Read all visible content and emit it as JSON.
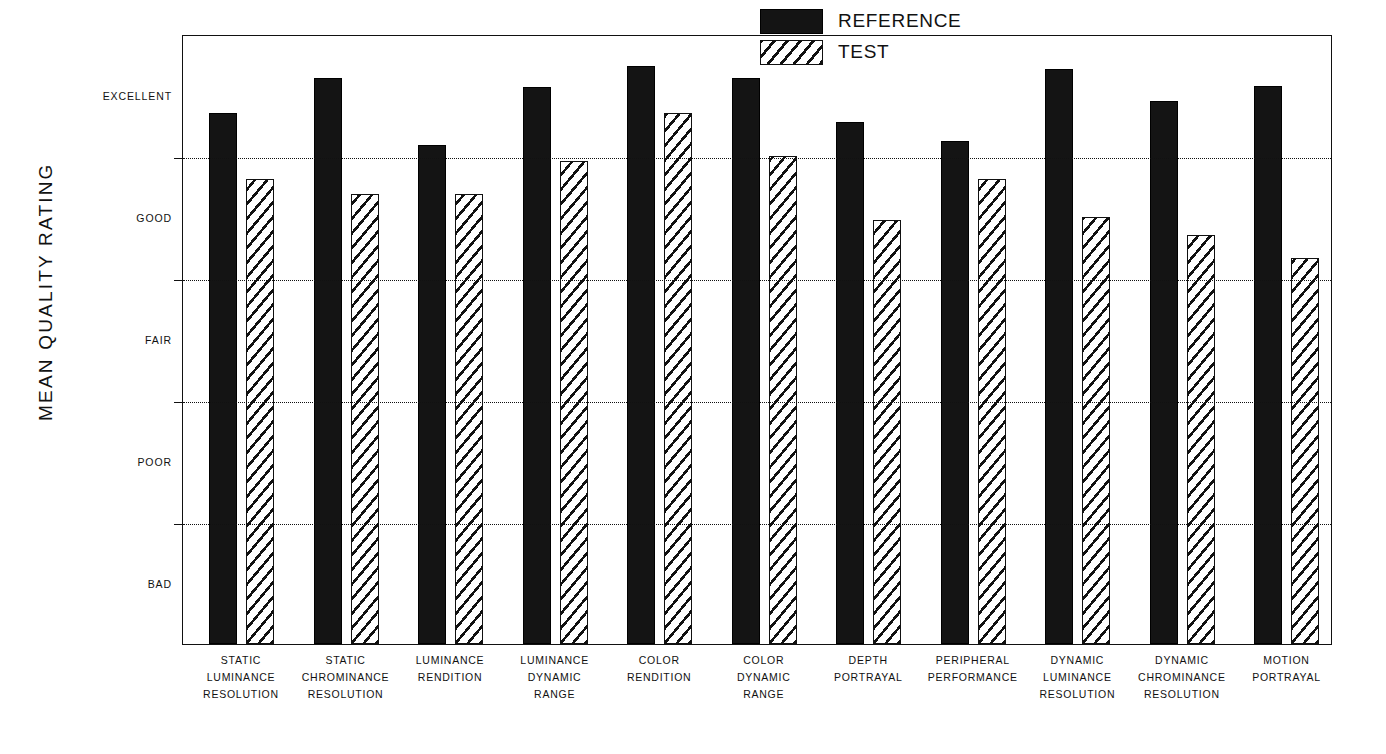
{
  "chart_data": {
    "type": "bar",
    "title": "",
    "xlabel": "",
    "ylabel": "MEAN QUALITY RATING",
    "ylim": [
      1,
      5
    ],
    "grid": true,
    "legend_position": "top-right",
    "y_tick_labels": [
      "BAD",
      "POOR",
      "FAIR",
      "GOOD",
      "EXCELLENT"
    ],
    "y_tick_values": [
      1,
      2,
      3,
      4,
      5
    ],
    "categories": [
      "STATIC LUMINANCE RESOLUTION",
      "STATIC CHROMINANCE RESOLUTION",
      "LUMINANCE RENDITION",
      "LUMINANCE DYNAMIC RANGE",
      "COLOR RENDITION",
      "COLOR DYNAMIC RANGE",
      "DEPTH PORTRAYAL",
      "PERIPHERAL PERFORMANCE",
      "DYNAMIC LUMINANCE RESOLUTION",
      "DYNAMIC CHROMINANCE RESOLUTION",
      "MOTION PORTRAYAL"
    ],
    "category_lines": [
      [
        "STATIC",
        "LUMINANCE",
        "RESOLUTION"
      ],
      [
        "STATIC",
        "CHROMINANCE",
        "RESOLUTION"
      ],
      [
        "LUMINANCE",
        "RENDITION"
      ],
      [
        "LUMINANCE",
        "DYNAMIC",
        "RANGE"
      ],
      [
        "COLOR",
        "RENDITION"
      ],
      [
        "COLOR",
        "DYNAMIC",
        "RANGE"
      ],
      [
        "DEPTH",
        "PORTRAYAL"
      ],
      [
        "PERIPHERAL",
        "PERFORMANCE"
      ],
      [
        "DYNAMIC",
        "LUMINANCE",
        "RESOLUTION"
      ],
      [
        "DYNAMIC",
        "CHROMINANCE",
        "RESOLUTION"
      ],
      [
        "MOTION",
        "PORTRAYAL"
      ]
    ],
    "series": [
      {
        "name": "REFERENCE",
        "fill": "solid-black",
        "color": "#141414",
        "values": [
          4.48,
          4.71,
          4.27,
          4.65,
          4.79,
          4.71,
          4.42,
          4.3,
          4.77,
          4.56,
          4.66
        ]
      },
      {
        "name": "TEST",
        "fill": "diagonal-hatch",
        "color": "#ffffff",
        "values": [
          4.05,
          3.95,
          3.95,
          4.17,
          4.48,
          4.2,
          3.78,
          4.05,
          3.8,
          3.68,
          3.53
        ]
      }
    ]
  },
  "legend": {
    "items": [
      {
        "label": "REFERENCE",
        "swatch": "solid"
      },
      {
        "label": "TEST",
        "swatch": "hatch"
      }
    ]
  },
  "axis": {
    "y_title": "MEAN QUALITY RATING"
  },
  "colors": {
    "reference_fill": "#141414",
    "test_fill": "#ffffff",
    "stroke": "#111111",
    "background": "#ffffff"
  }
}
